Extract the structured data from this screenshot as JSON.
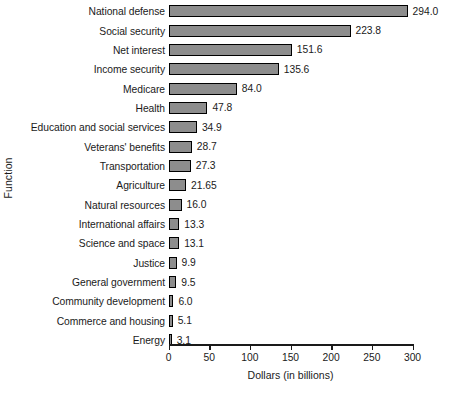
{
  "chart_data": {
    "type": "bar",
    "orientation": "horizontal",
    "title": "",
    "xlabel": "Dollars (in billions)",
    "ylabel": "Function",
    "xlim": [
      0,
      300
    ],
    "xticks": [
      0,
      50,
      100,
      150,
      200,
      250,
      300
    ],
    "xtick_labels": [
      "0",
      "50",
      "100",
      "150",
      "200",
      "250",
      "300"
    ],
    "grid": false,
    "legend": null,
    "bar_fill_color": "#8d8d8d",
    "bar_edge_color": "#000000",
    "background_color": "#ffffff",
    "categories": [
      "National defense",
      "Social security",
      "Net interest",
      "Income security",
      "Medicare",
      "Health",
      "Education and social services",
      "Veterans' benefits",
      "Transportation",
      "Agriculture",
      "Natural resources",
      "International affairs",
      "Science and space",
      "Justice",
      "General government",
      "Community development",
      "Commerce and housing",
      "Energy"
    ],
    "values": [
      294.0,
      223.8,
      151.6,
      135.6,
      84.0,
      47.8,
      34.9,
      28.7,
      27.3,
      21.65,
      16.0,
      13.3,
      13.1,
      9.9,
      9.5,
      6.0,
      5.1,
      3.1
    ],
    "value_labels": [
      "294.0",
      "223.8",
      "151.6",
      "135.6",
      "84.0",
      "47.8",
      "34.9",
      "28.7",
      "27.3",
      "21.65",
      "16.0",
      "13.3",
      "13.1",
      "9.9",
      "9.5",
      "6.0",
      "5.1",
      "3.1"
    ]
  }
}
